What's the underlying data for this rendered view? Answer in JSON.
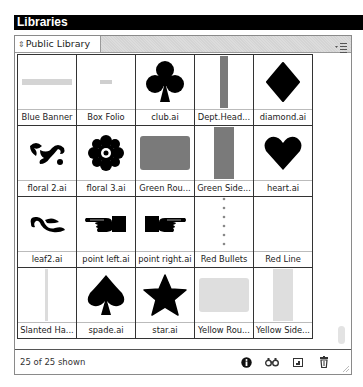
{
  "window": {
    "title": "Libraries"
  },
  "library": {
    "selected": "Public Library",
    "menu_icon": "panel-menu-icon"
  },
  "items": [
    {
      "label": "Blue Banner",
      "thumb": "hbar-light"
    },
    {
      "label": "Box Folio",
      "thumb": "small-dash"
    },
    {
      "label": "club.ai",
      "thumb": "club"
    },
    {
      "label": "Dept.Head...",
      "thumb": "vbar-gray"
    },
    {
      "label": "diamond.ai",
      "thumb": "diamond"
    },
    {
      "label": "floral 2.ai",
      "thumb": "floral2"
    },
    {
      "label": "floral 3.ai",
      "thumb": "floral3"
    },
    {
      "label": "Green Rou...",
      "thumb": "rect-gray"
    },
    {
      "label": "Green Side...",
      "thumb": "vbar-gray-wide"
    },
    {
      "label": "heart.ai",
      "thumb": "heart"
    },
    {
      "label": "leaf2.ai",
      "thumb": "leaf"
    },
    {
      "label": "point left.ai",
      "thumb": "point-left"
    },
    {
      "label": "point right.ai",
      "thumb": "point-right"
    },
    {
      "label": "Red Bullets",
      "thumb": "dots"
    },
    {
      "label": "Red Line",
      "thumb": "blank"
    },
    {
      "label": "Slanted Ha...",
      "thumb": "vline-light"
    },
    {
      "label": "spade.ai",
      "thumb": "spade"
    },
    {
      "label": "star.ai",
      "thumb": "star"
    },
    {
      "label": "Yellow Rou...",
      "thumb": "rect-light"
    },
    {
      "label": "Yellow Side...",
      "thumb": "vbar-light"
    }
  ],
  "footer": {
    "count_text": "25 of 25 shown",
    "buttons": [
      {
        "name": "info-button",
        "icon": "info-icon"
      },
      {
        "name": "find-button",
        "icon": "binoculars-icon"
      },
      {
        "name": "new-item-button",
        "icon": "new-item-icon"
      },
      {
        "name": "delete-button",
        "icon": "trash-icon"
      }
    ]
  },
  "colors": {
    "title_bg": "#000000",
    "grid_line": "#333333",
    "thumb_dark": "#000000",
    "thumb_gray": "#7a7a7a",
    "thumb_light": "#d9d9d9"
  }
}
